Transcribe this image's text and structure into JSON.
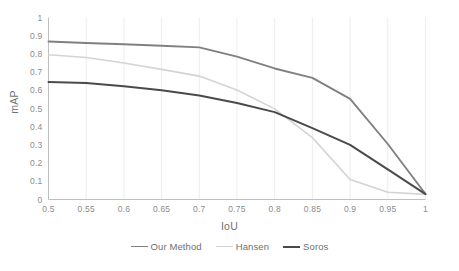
{
  "chart_data": {
    "type": "line",
    "title": "",
    "xlabel": "IoU",
    "ylabel": "mAP",
    "xlim": [
      0.5,
      1.0
    ],
    "ylim": [
      0,
      1
    ],
    "x": [
      0.5,
      0.55,
      0.6,
      0.65,
      0.7,
      0.75,
      0.8,
      0.85,
      0.9,
      0.95,
      1.0
    ],
    "xtick_labels": [
      "0.5",
      "0.55",
      "0.6",
      "0.65",
      "0.7",
      "0.75",
      "0.8",
      "0.85",
      "0.9",
      "0.95",
      "1"
    ],
    "ytick_labels": [
      "0",
      "0.1",
      "0.2",
      "0.3",
      "0.4",
      "0.5",
      "0.6",
      "0.7",
      "0.8",
      "0.9",
      "1"
    ],
    "ytick_values": [
      0,
      0.1,
      0.2,
      0.3,
      0.4,
      0.5,
      0.6,
      0.7,
      0.8,
      0.9,
      1
    ],
    "grid": "vertical-major-faint",
    "legend_position": "bottom-center",
    "series": [
      {
        "name": "Our Method",
        "color": "#808080",
        "width": 1.9,
        "values": [
          0.868,
          0.86,
          0.853,
          0.845,
          0.836,
          0.785,
          0.72,
          0.668,
          0.553,
          0.305,
          0.03
        ]
      },
      {
        "name": "Hansen",
        "color": "#d4d4d4",
        "width": 1.6,
        "values": [
          0.795,
          0.78,
          0.75,
          0.715,
          0.678,
          0.602,
          0.498,
          0.34,
          0.11,
          0.04,
          0.028
        ]
      },
      {
        "name": "Soros",
        "color": "#4a4a4a",
        "width": 2.0,
        "values": [
          0.645,
          0.64,
          0.622,
          0.6,
          0.572,
          0.53,
          0.48,
          0.392,
          0.3,
          0.166,
          0.03
        ]
      }
    ]
  },
  "axes": {
    "x_title": "IoU",
    "y_title": "mAP"
  },
  "legend": {
    "items": [
      {
        "label": "Our Method",
        "color": "#808080"
      },
      {
        "label": "Hansen",
        "color": "#d4d4d4"
      },
      {
        "label": "Soros",
        "color": "#4a4a4a"
      }
    ]
  },
  "colors": {
    "our_method": "#808080",
    "hansen": "#d4d4d4",
    "soros": "#4a4a4a",
    "axis": "#bfbfbf",
    "gridline": "#ededed",
    "tick_text": "#8c8c8c"
  }
}
